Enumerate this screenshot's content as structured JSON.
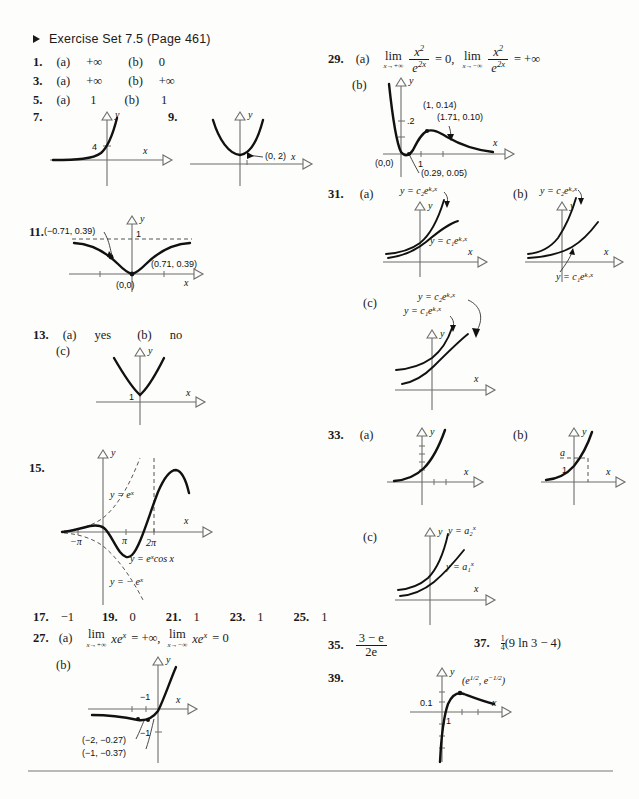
{
  "header": {
    "bullet_icon": "triangle-right-icon",
    "title": "Exercise Set 7.5 (Page 461)"
  },
  "answers": {
    "a1": {
      "num": "1.",
      "pa_label": "(a)",
      "pa": "+∞",
      "pb_label": "(b)",
      "pb": "0"
    },
    "a3": {
      "num": "3.",
      "pa_label": "(a)",
      "pa": "+∞",
      "pb_label": "(b)",
      "pb": "+∞"
    },
    "a5": {
      "num": "5.",
      "pa_label": "(a)",
      "pa": "1",
      "pb_label": "(b)",
      "pb": "1"
    },
    "a7": {
      "num": "7.",
      "y_mark": "4",
      "xlab": "x",
      "ylab": "y"
    },
    "a9": {
      "num": "9.",
      "point": "(0, 2)",
      "xlab": "x",
      "ylab": "y"
    },
    "a11": {
      "num": "11.",
      "left_point": "(−0.71, 0.39)",
      "right_point": "(0.71, 0.39)",
      "origin": "(0,0)",
      "asymptote": "1",
      "xlab": "x",
      "ylab": "y"
    },
    "a13": {
      "num": "13.",
      "pa_label": "(a)",
      "pa": "yes",
      "pb_label": "(b)",
      "pb": "no",
      "pc_label": "(c)",
      "y_mark": "1",
      "xlab": "x",
      "ylab": "y"
    },
    "a15": {
      "num": "15.",
      "curve_label": "y = e",
      "curve_label_sup": "x",
      "neg_label": "y = − e",
      "neg_label_sup": "x",
      "main_label": "y = e",
      "main_label_sup": "x",
      "main_label_rest": "cos x",
      "tick1": "π",
      "tick2": "2π",
      "tick_neg": "−π",
      "xlab": "x",
      "ylab": "y"
    },
    "a17": {
      "num": "17.",
      "val": "−1"
    },
    "a19": {
      "num": "19.",
      "val": "0"
    },
    "a21": {
      "num": "21.",
      "val": "1"
    },
    "a23": {
      "num": "23.",
      "val": "1"
    },
    "a25": {
      "num": "25.",
      "val": "1"
    },
    "a27": {
      "num": "27.",
      "pa_label": "(a)",
      "pb_label": "(b)",
      "lim1_op": "lim",
      "lim1_sub": "x→+∞",
      "lim1_expr": "xe",
      "lim1_sup": "x",
      "lim1_eq": "= +∞,",
      "lim2_op": "lim",
      "lim2_sub": "x→−∞",
      "lim2_expr": "xe",
      "lim2_sup": "x",
      "lim2_eq": "= 0",
      "y_mark": "−1",
      "y_mark2": "−1",
      "point1": "(−2, −0.27)",
      "point2": "(−1, −0.37)",
      "xlab": "x",
      "ylab": "y"
    },
    "a29": {
      "num": "29.",
      "pa_label": "(a)",
      "pb_label": "(b)",
      "lim1_op": "lim",
      "lim1_sub": "x→+∞",
      "num1": "x",
      "num1_sup": "2",
      "den1": "e",
      "den1_sup": "2x",
      "eq1": "= 0,",
      "lim2_op": "lim",
      "lim2_sub": "x→−∞",
      "num2": "x",
      "num2_sup": "2",
      "den2": "e",
      "den2_sup": "2x",
      "eq2": "= +∞",
      "y_mark": ".2",
      "x_mark": "1",
      "origin": "(0,0)",
      "point1": "(1, 0.14)",
      "point2": "(1.71, 0.10)",
      "point3": "(0.29, 0.05)",
      "xlab": "x",
      "ylab": "y"
    },
    "a31": {
      "num": "31.",
      "pa_label": "(a)",
      "pb_label": "(b)",
      "pc_label": "(c)",
      "curve2": "y = c₂e",
      "curve2_sup": "k₂x",
      "curve1": "y = c₁e",
      "curve1_sup": "k₁x",
      "xlab": "x",
      "ylab": "y"
    },
    "a33": {
      "num": "33.",
      "pa_label": "(a)",
      "pb_label": "(b)",
      "pc_label": "(c)",
      "b_a": "a",
      "b_1": "1",
      "curve2": "y = a₂",
      "curve2_sup": "x",
      "curve1": "y = a₁",
      "curve1_sup": "x",
      "xlab": "x",
      "ylab": "y"
    },
    "a35": {
      "num": "35.",
      "frac_top": "3 − e",
      "frac_bot": "2e"
    },
    "a37": {
      "num": "37.",
      "coef_top": "1",
      "coef_bot": "4",
      "expr": "(9 ln 3 − 4)"
    },
    "a39": {
      "num": "39.",
      "point": "(e",
      "point_sup1": "1/2",
      "point_mid": ", e",
      "point_sup2": "−1/2",
      "point_end": ")",
      "y_mark": "0.1",
      "x_mark": "1",
      "xlab": "x",
      "ylab": "y"
    }
  }
}
